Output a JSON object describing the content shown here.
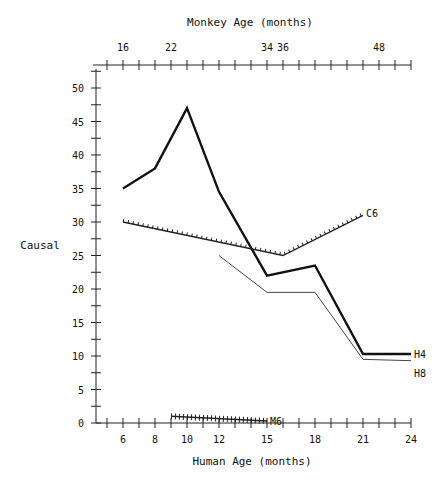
{
  "chart_data": {
    "type": "line",
    "title": "",
    "top_axis_label": "Monkey Age (months)",
    "top_axis_ticks": [
      {
        "label": "16",
        "human_equiv": 6
      },
      {
        "label": "22",
        "human_equiv": 9
      },
      {
        "label": "34",
        "human_equiv": 15
      },
      {
        "label": "36",
        "human_equiv": 16
      },
      {
        "label": "48",
        "human_equiv": 22
      }
    ],
    "xlabel": "Human Age (months)",
    "ylabel": "Causal",
    "x_ticks": [
      "6",
      "8",
      "10",
      "12",
      "15",
      "18",
      "21",
      "24"
    ],
    "x_tick_positions": [
      6,
      8,
      10,
      12,
      15,
      18,
      21,
      24
    ],
    "y_ticks": [
      "0",
      "5",
      "10",
      "15",
      "20",
      "25",
      "30",
      "35",
      "40",
      "45",
      "50"
    ],
    "xlim": [
      4.125,
      24
    ],
    "ylim": [
      0,
      52.5
    ],
    "grid": false,
    "legend": "inline labels at line ends",
    "series": [
      {
        "name": "H4",
        "style": "thick solid",
        "x": [
          6,
          8,
          10,
          12,
          15,
          18,
          21,
          24
        ],
        "y": [
          35,
          38,
          47,
          34.5,
          22,
          23.5,
          10.3,
          10.3
        ]
      },
      {
        "name": "H8",
        "style": "thin solid",
        "x": [
          12,
          15,
          18,
          21,
          24
        ],
        "y": [
          25,
          19.5,
          19.5,
          9.5,
          9.3
        ]
      },
      {
        "name": "C6",
        "style": "dotted with tick marks",
        "x": [
          6,
          16,
          21
        ],
        "y": [
          30,
          25,
          31
        ]
      },
      {
        "name": "M6",
        "style": "hatched with cross marks",
        "x": [
          9,
          15
        ],
        "y": [
          1,
          0.3
        ]
      }
    ]
  },
  "labels": {
    "top_axis_title": "Monkey Age (months)",
    "bottom_axis_title": "Human Age (months)",
    "y_axis_title": "Causal",
    "series_h4": "H4",
    "series_h8": "H8",
    "series_c6": "C6",
    "series_m6": "M6"
  }
}
